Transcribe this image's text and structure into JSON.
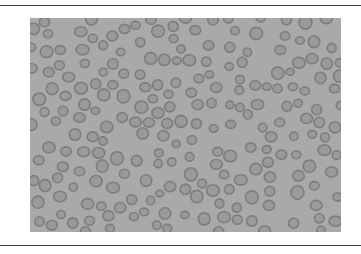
{
  "figure": {
    "background_color": "#a9a9a9",
    "cell_fill": "#9a9a9a",
    "cell_stroke": "#7d7d7d",
    "rule_color": "#3a3a3a",
    "width": 311,
    "height": 214,
    "cell_count_approx": 220
  }
}
